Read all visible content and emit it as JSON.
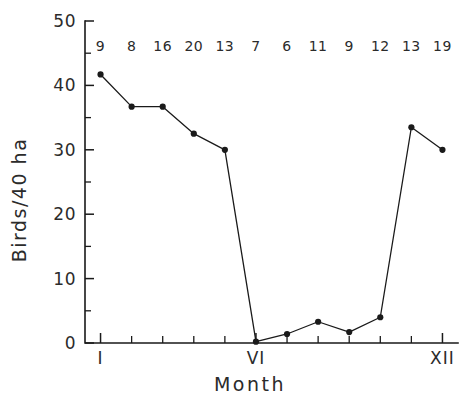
{
  "chart_data": {
    "type": "line",
    "title": "",
    "xlabel": "Month",
    "ylabel": "Birds/40 ha",
    "x": [
      1,
      2,
      3,
      4,
      5,
      6,
      7,
      8,
      9,
      10,
      11,
      12
    ],
    "values": [
      41.7,
      36.7,
      36.7,
      32.5,
      30.0,
      0.2,
      1.4,
      3.3,
      1.7,
      4.0,
      33.5,
      30.0
    ],
    "point_labels": [
      "9",
      "8",
      "16",
      "20",
      "13",
      "7",
      "6",
      "11",
      "9",
      "12",
      "13",
      "19"
    ],
    "xlim": [
      0.5,
      12.5
    ],
    "ylim": [
      0,
      50
    ],
    "ytick_values": [
      0,
      10,
      20,
      30,
      40,
      50
    ],
    "ytick_labels": [
      "0",
      "10",
      "20",
      "30",
      "40",
      "50"
    ],
    "yminor_values": [
      5,
      15,
      25,
      35,
      45
    ],
    "xtick_values": [
      1,
      2,
      3,
      4,
      5,
      6,
      7,
      8,
      9,
      10,
      11,
      12
    ],
    "xtick_labels": [
      "I",
      "",
      "",
      "",
      "",
      "VI",
      "",
      "",
      "",
      "",
      "",
      "XII"
    ],
    "grid": false,
    "legend": null,
    "line_color": "#1a1a1a",
    "marker_color": "#1a1a1a",
    "marker": "circle",
    "background": "#ffffff"
  }
}
